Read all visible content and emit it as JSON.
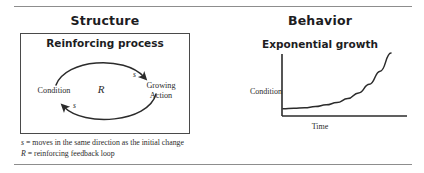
{
  "figure": {
    "left_panel": {
      "title": "Structure",
      "box_caption": "Reinforcing process",
      "diagram": {
        "node_condition": "Condition",
        "node_growing_action": "Growing\nAction",
        "node_growing_action_line1": "Growing",
        "node_growing_action_line2": "Action",
        "loop_identifier": "R",
        "polarity_top": "s",
        "polarity_bottom": "s",
        "arrow_color": "#2b2b2b"
      },
      "legend": [
        {
          "symbol": "s",
          "separator": " = ",
          "text": "moves in the same direction as the initial change"
        },
        {
          "symbol": "R",
          "separator": " = ",
          "text": "reinforcing feedback loop"
        }
      ]
    },
    "right_panel": {
      "title": "Behavior",
      "graph_caption": "Exponential growth",
      "y_axis_label": "Condition",
      "x_axis_label": "Time"
    },
    "colors": {
      "text": "#1d1d1f",
      "ink": "#2b2b2b",
      "rule": "#8d8d8d",
      "box_border": "#4a4a4a"
    }
  },
  "chart_data": {
    "type": "line",
    "title": "Exponential growth",
    "xlabel": "Time",
    "ylabel": "Condition",
    "grid": false,
    "legend": "none",
    "x": [
      0,
      0.1,
      0.2,
      0.3,
      0.4,
      0.5,
      0.6,
      0.7,
      0.8,
      0.9,
      1.0
    ],
    "values": [
      0.02,
      0.03,
      0.04,
      0.06,
      0.09,
      0.13,
      0.2,
      0.3,
      0.45,
      0.68,
      1.0
    ],
    "xlim": [
      0,
      1
    ],
    "ylim": [
      0,
      1
    ],
    "tick_labels_x": [],
    "tick_labels_y": []
  }
}
